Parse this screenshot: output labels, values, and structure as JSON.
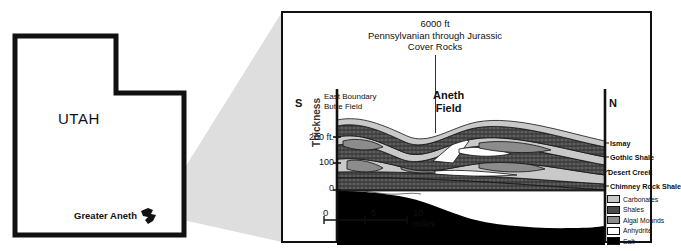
{
  "locator_map": {
    "state_label": "UTAH",
    "field_label": "Greater Aneth",
    "marker_icon": "field-outline-marker"
  },
  "cross_section": {
    "title_lines": {
      "line1": "6000 ft",
      "line2": "Pennsylvanian through Jurassic",
      "line3": "Cover Rocks"
    },
    "direction_left": "S",
    "direction_right": "N",
    "field_labels": {
      "left_line1": "East Boundary",
      "left_line2": "Butte Field",
      "center_line1": "Aneth",
      "center_line2": "Field"
    },
    "y_axis": {
      "label": "Thickness",
      "ticks": [
        "200 ft.",
        "100",
        "0"
      ]
    },
    "scale_bar": {
      "t0": "0",
      "t5": "5",
      "t10": "10 miles"
    },
    "strat_labels": [
      "Ismay",
      "Gothic Shale",
      "Desert Creek",
      "Chimney Rock Shale"
    ],
    "legend": [
      {
        "label": "Carbonates",
        "color": "#c9c9c9"
      },
      {
        "label": "Shales",
        "color": "#4a4a4a"
      },
      {
        "label": "Algal Mounds",
        "color": "#8c8c8c"
      },
      {
        "label": "Anhydrite",
        "color": "#ffffff"
      },
      {
        "label": "Salt",
        "color": "#000000"
      }
    ]
  }
}
